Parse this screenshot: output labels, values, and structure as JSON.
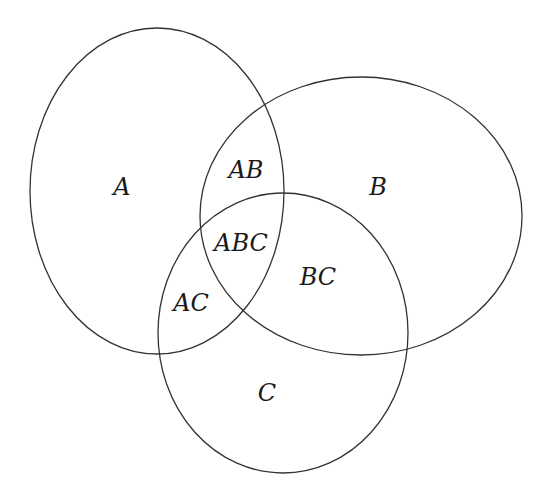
{
  "diagram": {
    "type": "venn",
    "sets": [
      {
        "name": "A",
        "cx": 157,
        "cy": 191,
        "rx": 127,
        "ry": 163
      },
      {
        "name": "B",
        "cx": 361,
        "cy": 216,
        "rx": 161,
        "ry": 139
      },
      {
        "name": "C",
        "cx": 283,
        "cy": 333,
        "rx": 125,
        "ry": 140
      }
    ],
    "regions": [
      {
        "label": "A",
        "x": 122,
        "y": 195
      },
      {
        "label": "AB",
        "x": 246,
        "y": 178
      },
      {
        "label": "B",
        "x": 378,
        "y": 195
      },
      {
        "label": "ABC",
        "x": 241,
        "y": 251
      },
      {
        "label": "BC",
        "x": 318,
        "y": 285
      },
      {
        "label": "AC",
        "x": 191,
        "y": 311
      },
      {
        "label": "C",
        "x": 267,
        "y": 401
      }
    ],
    "stroke_color": "#333333",
    "text_color": "#1a1a1a"
  }
}
